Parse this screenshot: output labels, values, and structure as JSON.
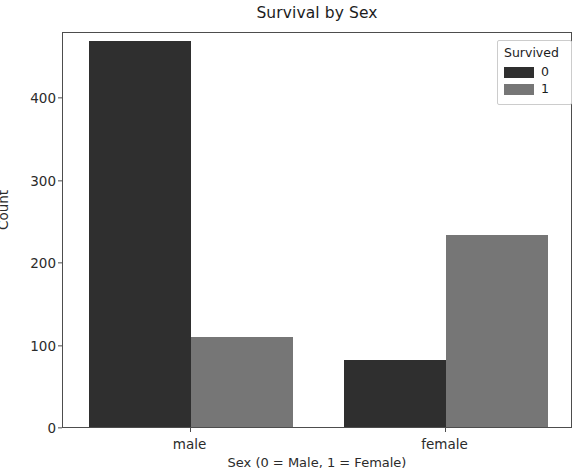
{
  "chart_data": {
    "type": "bar",
    "title": "Survival by Sex",
    "xlabel": "Sex (0 = Male, 1 = Female)",
    "ylabel": "Count",
    "categories": [
      "male",
      "female"
    ],
    "series": [
      {
        "name": "0",
        "values": [
          468,
          81
        ],
        "color": "#2f2f2f"
      },
      {
        "name": "1",
        "values": [
          109,
          233
        ],
        "color": "#767676"
      }
    ],
    "legend": {
      "title": "Survived",
      "position": "upper right",
      "entries": [
        {
          "label": "0",
          "color": "#2f2f2f"
        },
        {
          "label": "1",
          "color": "#767676"
        }
      ]
    },
    "yticks": [
      0,
      100,
      200,
      300,
      400
    ],
    "ytick_labels": [
      "0",
      "100",
      "200",
      "300",
      "400"
    ],
    "xtick_labels": [
      "male",
      "female"
    ],
    "ylim": [
      0,
      480
    ],
    "grid": false
  },
  "axis": {
    "y": {
      "t0": "0",
      "t1": "100",
      "t2": "200",
      "t3": "300",
      "t4": "400",
      "label": "Count"
    },
    "x": {
      "t0": "male",
      "t1": "female",
      "label": "Sex (0 = Male, 1 = Female)"
    }
  },
  "legend": {
    "title": "Survived",
    "e0": "0",
    "e1": "1"
  },
  "title": "Survival by Sex"
}
